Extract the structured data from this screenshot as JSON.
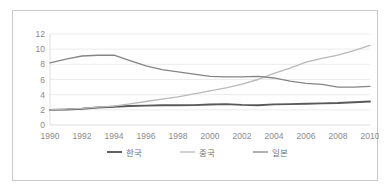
{
  "chart_data": {
    "type": "line",
    "title": "",
    "xlabel": "",
    "ylabel": "",
    "x": [
      1990,
      1991,
      1992,
      1993,
      1994,
      1995,
      1996,
      1997,
      1998,
      1999,
      2000,
      2001,
      2002,
      2003,
      2004,
      2005,
      2006,
      2007,
      2008,
      2009,
      2010
    ],
    "xlim": [
      1990,
      2010
    ],
    "ylim": [
      0,
      12
    ],
    "y_ticks": [
      0,
      2,
      4,
      6,
      8,
      10,
      12
    ],
    "x_ticks": [
      1990,
      1992,
      1994,
      1996,
      1998,
      2000,
      2002,
      2004,
      2006,
      2008,
      2010
    ],
    "grid": true,
    "legend_position": "bottom",
    "series": [
      {
        "name": "한국",
        "color": "#595959",
        "width": 1.9,
        "values": [
          2.0,
          2.05,
          2.15,
          2.3,
          2.4,
          2.5,
          2.55,
          2.6,
          2.6,
          2.62,
          2.7,
          2.75,
          2.65,
          2.6,
          2.72,
          2.75,
          2.8,
          2.85,
          2.9,
          3.0,
          3.1
        ]
      },
      {
        "name": "중국",
        "color": "#b8b8b8",
        "width": 1.3,
        "values": [
          2.0,
          2.1,
          2.2,
          2.35,
          2.5,
          2.8,
          3.1,
          3.4,
          3.7,
          4.1,
          4.5,
          4.9,
          5.4,
          6.0,
          6.8,
          7.5,
          8.3,
          8.8,
          9.2,
          9.8,
          10.5
        ]
      },
      {
        "name": "일본",
        "color": "#858585",
        "width": 1.3,
        "values": [
          8.2,
          8.7,
          9.1,
          9.2,
          9.2,
          8.5,
          7.8,
          7.3,
          7.0,
          6.7,
          6.4,
          6.35,
          6.35,
          6.4,
          6.2,
          5.8,
          5.5,
          5.35,
          5.0,
          5.0,
          5.1
        ]
      }
    ]
  },
  "axis": {
    "y_tick_labels": [
      "0",
      "2",
      "4",
      "6",
      "8",
      "10",
      "12"
    ],
    "x_tick_labels": [
      "1990",
      "1992",
      "1994",
      "1996",
      "1998",
      "2000",
      "2002",
      "2004",
      "2006",
      "2008",
      "2010"
    ]
  },
  "legend": {
    "items": [
      {
        "label": "한국",
        "color": "#595959"
      },
      {
        "label": "중국",
        "color": "#b8b8b8"
      },
      {
        "label": "일본",
        "color": "#858585"
      }
    ]
  },
  "colors": {
    "frame_border": "#c9c9c9",
    "gridline": "#e2e2e2",
    "tick_text": "#8a8a8a",
    "legend_text": "#6f6f6f",
    "background": "#ffffff"
  }
}
